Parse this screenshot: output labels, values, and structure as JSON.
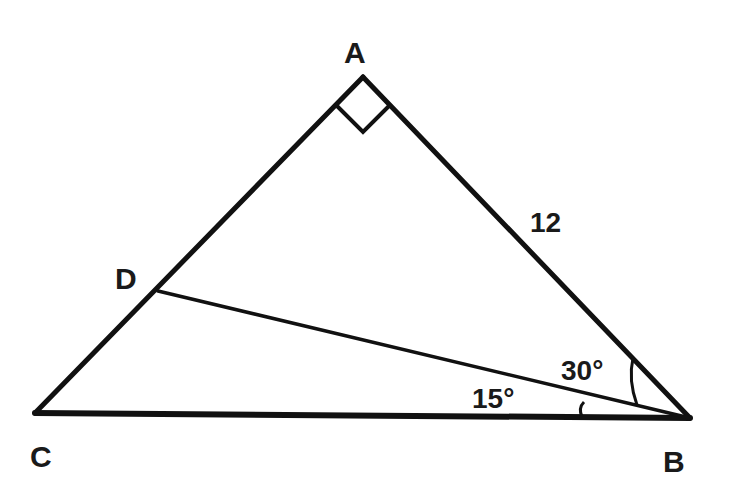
{
  "diagram": {
    "type": "geometry-triangle",
    "colors": {
      "stroke": "#111111",
      "background": "#ffffff",
      "text": "#1a1a1a"
    },
    "vertices": {
      "A": {
        "label": "A",
        "x": 363,
        "y": 77
      },
      "B": {
        "label": "B",
        "x": 690,
        "y": 418
      },
      "C": {
        "label": "C",
        "x": 35,
        "y": 413
      },
      "D": {
        "label": "D",
        "x": 158,
        "y": 291
      }
    },
    "segments": [
      {
        "from": "A",
        "to": "B"
      },
      {
        "from": "A",
        "to": "C"
      },
      {
        "from": "C",
        "to": "B"
      },
      {
        "from": "D",
        "to": "B"
      }
    ],
    "right_angle_at": "A",
    "side_labels": {
      "AB": "12"
    },
    "angle_labels": {
      "ABD": "30°",
      "DBC": "15°"
    }
  }
}
